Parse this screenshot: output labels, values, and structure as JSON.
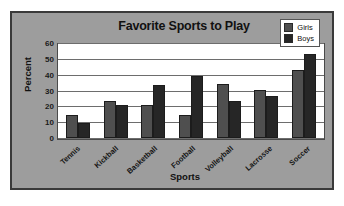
{
  "chart_data": {
    "type": "bar",
    "title": "Favorite Sports to Play",
    "xlabel": "Sports",
    "ylabel": "Percent",
    "categories": [
      "Tennis",
      "Kickball",
      "Basketball",
      "Football",
      "Volleyball",
      "Lacrosse",
      "Soccer"
    ],
    "series": [
      {
        "name": "Girls",
        "color": "#4f4f4f",
        "values": [
          15,
          24,
          21,
          15,
          35,
          31,
          44
        ]
      },
      {
        "name": "Boys",
        "color": "#262626",
        "values": [
          10,
          21,
          34,
          40,
          24,
          27,
          54
        ]
      }
    ],
    "ylim": [
      0,
      60
    ],
    "ytick_step": 10,
    "yticks": [
      0,
      10,
      20,
      30,
      40,
      50,
      60
    ],
    "ytick_labels": [
      "0",
      "10",
      "20",
      "30",
      "40",
      "50",
      "60"
    ],
    "grid": true,
    "grid_axis": "y",
    "legend_position": "top-right",
    "xtick_rotation": -42
  },
  "style": {
    "frame_border_color": "#3a3a3a",
    "chart_background": "#9d9d9d",
    "plot_background": "#ffffff",
    "gridline_color": "#6d6d6d",
    "text_color": "#111111"
  }
}
